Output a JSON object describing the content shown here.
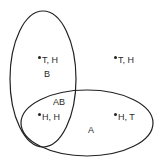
{
  "diagram": {
    "type": "venn",
    "sets": [
      {
        "name": "B",
        "label": "B",
        "shape": "ellipse-vertical"
      },
      {
        "name": "A",
        "label": "A",
        "shape": "ellipse-horizontal"
      }
    ],
    "intersection_label": "AB",
    "points": [
      {
        "label": "T, H",
        "region": "B only"
      },
      {
        "label": "T, H",
        "region": "outside"
      },
      {
        "label": "H, H",
        "region": "AB"
      },
      {
        "label": "H, T",
        "region": "A only"
      }
    ],
    "colors": {
      "stroke": "#222222",
      "background": "#ffffff",
      "text": "#2a2a2a"
    }
  }
}
